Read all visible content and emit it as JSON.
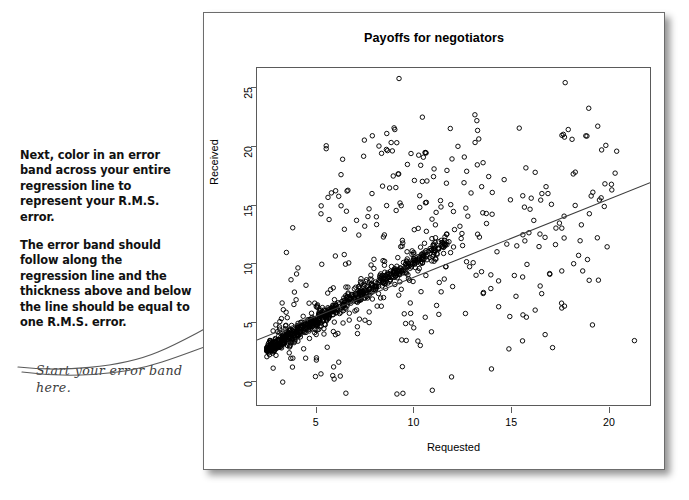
{
  "instructions": {
    "paragraph1": "Next, color in an error band across your entire regression line to represent your R.M.S. error.",
    "paragraph2": "The error band should follow along the regression line and the thickness above and below the line should be equal to one R.M.S. error."
  },
  "handwritten_note": {
    "text": "Start your error band here."
  },
  "figure": {
    "title": "Payoffs for negotiators"
  },
  "chart_data": {
    "type": "scatter",
    "title": "Payoffs for negotiators",
    "xlabel": "Requested",
    "ylabel": "Received",
    "xlim": [
      2.0,
      22.2
    ],
    "ylim": [
      -2.2,
      26.6
    ],
    "xticks": [
      5,
      10,
      15,
      20
    ],
    "yticks": [
      0,
      5,
      10,
      15,
      20,
      25
    ],
    "grid": false,
    "legend": null,
    "marker": "open-circle",
    "marker_color": "#000000",
    "n_points_approx": 900,
    "regression_line": {
      "label": "regression line",
      "x_start": 2.0,
      "y_start": 3.35,
      "x_end": 22.2,
      "y_end": 16.8,
      "slope": 0.666,
      "intercept": 2.02,
      "color": "#3c3c3c"
    },
    "notable_points": [
      {
        "x": 9.3,
        "y": 25.7
      },
      {
        "x": 10.5,
        "y": 22.4
      },
      {
        "x": 13.2,
        "y": 22.6
      },
      {
        "x": 13.3,
        "y": 22.1
      },
      {
        "x": 18.9,
        "y": 20.8
      },
      {
        "x": 6.4,
        "y": 18.8
      },
      {
        "x": 9.5,
        "y": -1.2
      },
      {
        "x": 21.4,
        "y": 3.3
      },
      {
        "x": 12.0,
        "y": 0.2
      },
      {
        "x": 4.5,
        "y": 1.8
      }
    ]
  },
  "axis_tick_labels": {
    "y": [
      "0",
      "5",
      "10",
      "15",
      "20",
      "25"
    ],
    "x": [
      "5",
      "10",
      "15",
      "20"
    ]
  }
}
